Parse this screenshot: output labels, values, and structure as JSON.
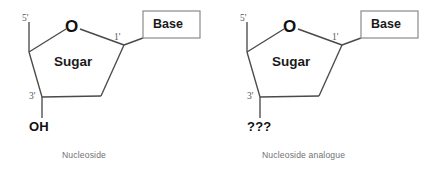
{
  "figure": {
    "background_color": "#ffffff",
    "bond_color": "#4a4a4a",
    "box_border_color": "#8a8a8a",
    "caption_color": "#6f7276"
  },
  "panels": [
    {
      "id": "nucleoside",
      "caption": "Nucleoside",
      "ring_center_label": "Sugar",
      "ring_oxygen_label": "O",
      "carbon_labels": {
        "c5": "5'",
        "c1": "1'",
        "c3": "3'"
      },
      "base_box_label": "Base",
      "substituent_label": "OH"
    },
    {
      "id": "nucleoside-analogue",
      "caption": "Nucleoside analogue",
      "ring_center_label": "Sugar",
      "ring_oxygen_label": "O",
      "carbon_labels": {
        "c5": "5'",
        "c1": "1'",
        "c3": "3'"
      },
      "base_box_label": "Base",
      "substituent_label": "???"
    }
  ]
}
